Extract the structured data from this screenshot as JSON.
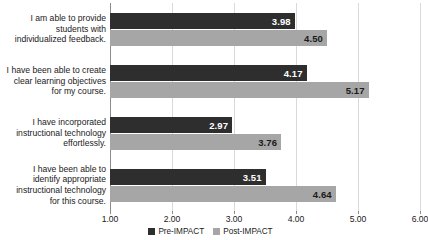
{
  "chart_data": {
    "type": "bar",
    "orientation": "horizontal",
    "title": "",
    "subtitle": "",
    "xlabel": "",
    "ylabel": "",
    "xlim": [
      1.0,
      6.0
    ],
    "grid": true,
    "legend_position": "bottom-center",
    "tick_labels": [
      "1.00",
      "2.00",
      "3.00",
      "4.00",
      "5.00",
      "6.00"
    ],
    "tick_values": [
      1.0,
      2.0,
      3.0,
      4.0,
      5.0,
      6.0
    ],
    "categories": [
      "I am able to provide\nstudents with\nindividualized feedback.",
      "I have been able to create\nclear learning objectives\nfor my course.",
      "I have incorporated\ninstructional technology\neffortlessly.",
      "I have been able to\nidentify appropriate\ninstructional technology\nfor this course."
    ],
    "series": [
      {
        "name": "Pre-IMPACT",
        "color": "#2e2e2e",
        "values": [
          3.98,
          4.17,
          2.97,
          3.51
        ],
        "labels": [
          "3.98",
          "4.17",
          "2.97",
          "3.51"
        ]
      },
      {
        "name": "Post-IMPACT",
        "color": "#a6a6a6",
        "values": [
          4.5,
          5.17,
          3.76,
          4.64
        ],
        "labels": [
          "4.50",
          "5.17",
          "3.76",
          "4.64"
        ]
      }
    ]
  }
}
